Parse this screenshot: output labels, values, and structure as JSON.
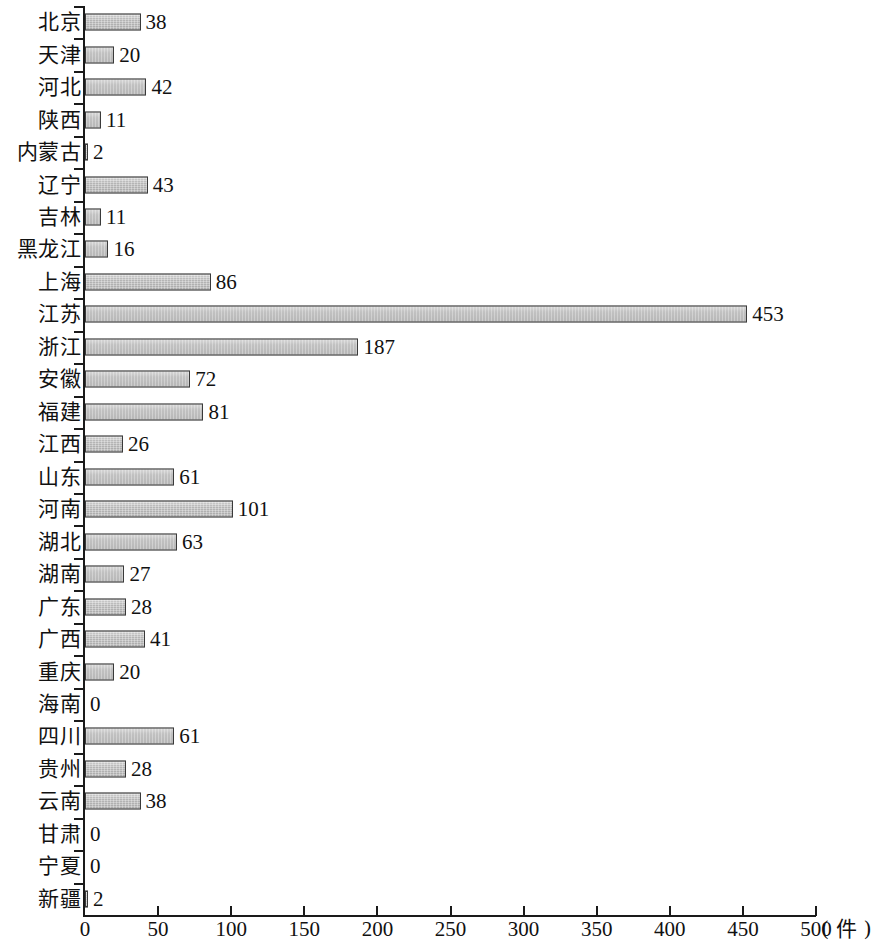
{
  "chart_data": {
    "type": "bar",
    "orientation": "horizontal",
    "title": "",
    "xlabel": "",
    "ylabel": "",
    "unit_label": "( 件 )",
    "xlim": [
      0,
      500
    ],
    "xticks": [
      0,
      50,
      100,
      150,
      200,
      250,
      300,
      350,
      400,
      450,
      500
    ],
    "grid": false,
    "legend": null,
    "bar_fill_color": "#bcbcbc",
    "bar_border_color": "#3a3a3a",
    "axis_color": "#1a1a1a",
    "categories": [
      "北京",
      "天津",
      "河北",
      "陕西",
      "内蒙古",
      "辽宁",
      "吉林",
      "黑龙江",
      "上海",
      "江苏",
      "浙江",
      "安徽",
      "福建",
      "江西",
      "山东",
      "河南",
      "湖北",
      "湖南",
      "广东",
      "广西",
      "重庆",
      "海南",
      "四川",
      "贵州",
      "云南",
      "甘肃",
      "宁夏",
      "新疆"
    ],
    "values": [
      38,
      20,
      42,
      11,
      2,
      43,
      11,
      16,
      86,
      453,
      187,
      72,
      81,
      26,
      61,
      101,
      63,
      27,
      28,
      41,
      20,
      0,
      61,
      28,
      38,
      0,
      0,
      2
    ],
    "series": [
      {
        "name": "",
        "values": [
          38,
          20,
          42,
          11,
          2,
          43,
          11,
          16,
          86,
          453,
          187,
          72,
          81,
          26,
          61,
          101,
          63,
          27,
          28,
          41,
          20,
          0,
          61,
          28,
          38,
          0,
          0,
          2
        ]
      }
    ],
    "value_labels": [
      "38",
      "20",
      "42",
      "11",
      "2",
      "43",
      "11",
      "16",
      "86",
      "453",
      "187",
      "72",
      "81",
      "26",
      "61",
      "101",
      "63",
      "27",
      "28",
      "41",
      "20",
      "0",
      "61",
      "28",
      "38",
      "0",
      "0",
      "2"
    ],
    "xtick_labels": [
      "0",
      "50",
      "100",
      "150",
      "200",
      "250",
      "300",
      "350",
      "400",
      "450",
      "500"
    ]
  }
}
